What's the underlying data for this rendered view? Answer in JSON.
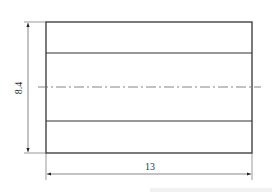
{
  "drawing": {
    "type": "engineering-dimension-drawing",
    "width_label": "13",
    "height_label": "8.4",
    "line_color": "#333333",
    "dim_color": "#555555",
    "centerline_color": "#666666"
  }
}
